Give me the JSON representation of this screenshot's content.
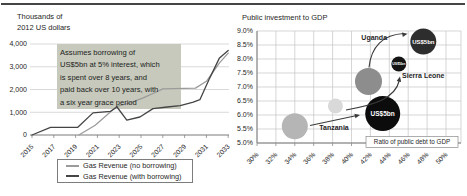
{
  "figure": {
    "rule_color": "#454545",
    "background": "#ffffff"
  },
  "left_chart": {
    "y_axis_title_lines": [
      "Thousands of",
      "2012 US dollars"
    ],
    "y_ticks": [
      "4,000",
      "3,000",
      "2,000",
      "1,000",
      "0"
    ],
    "x_ticks": [
      "2015",
      "2017",
      "2019",
      "2021",
      "2023",
      "2025",
      "2027",
      "2029",
      "2031",
      "2033"
    ],
    "annotation_bg": "#c6c9bb",
    "annotation_lines": [
      "Assumes borrowing of",
      "US$5bn at 5% interest, which",
      "is spent over 8 years, and",
      "paid back over 10 years, with",
      "a six year grace period"
    ],
    "legend": [
      {
        "label": "Gas Revenue (no borrowing)",
        "color": "#9b9b9b"
      },
      {
        "label": "Gas Revenue (with borrowing)",
        "color": "#454545"
      }
    ]
  },
  "right_chart": {
    "title": "Public investment to GDP",
    "x_axis_label": "Ratio of public debt to GDP",
    "y_ticks": [
      "9.0%",
      "8.5%",
      "8.0%",
      "7.5%",
      "7.0%",
      "6.5%",
      "6.0%",
      "5.5%",
      "5.0%"
    ],
    "x_ticks": [
      "30%",
      "32%",
      "34%",
      "36%",
      "38%",
      "40%",
      "42%",
      "44%",
      "46%",
      "48%",
      "50%"
    ]
  },
  "chart_data": [
    {
      "type": "line",
      "title": "Thousands of 2012 US dollars",
      "xlabel": "Year",
      "ylabel": "Thousands of 2012 US dollars",
      "xlim": [
        2015,
        2033
      ],
      "ylim": [
        0,
        4000
      ],
      "grid": "horizontal only",
      "legend_position": "bottom center, boxed",
      "annotation": "Assumes borrowing of US$5bn at 5% interest, which is spent over 8 years, and paid back over 10 years, with a six year grace period",
      "series": [
        {
          "name": "Gas Revenue (no borrowing)",
          "color": "#9b9b9b",
          "points": [
            [
              2019.3,
              0
            ],
            [
              2020.8,
              430
            ],
            [
              2021.9,
              890
            ],
            [
              2022.8,
              1260
            ],
            [
              2024,
              1410
            ],
            [
              2025.2,
              1630
            ],
            [
              2026.4,
              1890
            ],
            [
              2027,
              2030
            ],
            [
              2030,
              2060
            ],
            [
              2031,
              2360
            ],
            [
              2032.2,
              3170
            ],
            [
              2033,
              3600
            ]
          ]
        },
        {
          "name": "Gas Revenue (with borrowing)",
          "color": "#454545",
          "points": [
            [
              2015,
              0
            ],
            [
              2016.7,
              340
            ],
            [
              2019.2,
              340
            ],
            [
              2020.6,
              970
            ],
            [
              2022.2,
              1040
            ],
            [
              2022.8,
              1230
            ],
            [
              2023.7,
              650
            ],
            [
              2024.9,
              790
            ],
            [
              2026.1,
              1160
            ],
            [
              2027.4,
              1230
            ],
            [
              2028.6,
              1290
            ],
            [
              2029.8,
              1440
            ],
            [
              2030.4,
              1550
            ],
            [
              2031.3,
              2500
            ],
            [
              2032.2,
              3390
            ],
            [
              2033,
              3720
            ]
          ]
        }
      ]
    },
    {
      "type": "scatter",
      "title": "Public investment to GDP",
      "xlabel": "Ratio of public debt to GDP",
      "ylabel": "Public investment to GDP",
      "xlim": [
        30,
        50
      ],
      "ylim": [
        5.0,
        9.0
      ],
      "grid": "full",
      "bubbles": [
        {
          "name": "tanzania-current",
          "x": 34.0,
          "y": 5.6,
          "r": 13,
          "color": "#b5b5b5"
        },
        {
          "name": "sierra-leone-current",
          "x": 38.3,
          "y": 6.32,
          "r": 7.5,
          "color": "#d9d9d9"
        },
        {
          "name": "uganda-current",
          "x": 41.8,
          "y": 7.2,
          "r": 13.5,
          "color": "#8d8d8d"
        },
        {
          "name": "us5bn-tanzania",
          "x": 43.3,
          "y": 6.05,
          "r": 17.5,
          "color": "#0c0c0c",
          "label_inside": "US$5bn",
          "label_size": 6.5
        },
        {
          "name": "us5bn-sierra-leone",
          "x": 45.0,
          "y": 7.82,
          "r": 7.5,
          "color": "#141414",
          "label_inside": "US$5bn",
          "label_size": 3.5
        },
        {
          "name": "us5bn-uganda",
          "x": 47.6,
          "y": 8.62,
          "r": 13,
          "color": "#2d2d2d",
          "label_inside": "US$5bn",
          "label_size": 6
        }
      ],
      "labels": [
        {
          "name": "tanzania",
          "text": "Tanzania",
          "x": 38.15,
          "y": 5.46,
          "anchor": "middle"
        },
        {
          "name": "uganda",
          "text": "Uganda",
          "x": 42.4,
          "y": 8.68,
          "anchor": "middle"
        },
        {
          "name": "sierra-leone",
          "text": "Sierra Leone",
          "x": 45.35,
          "y": 7.32,
          "anchor": "start"
        }
      ],
      "arrows": [
        {
          "from": "tanzania-current",
          "to": "us5bn-tanzania"
        },
        {
          "from": "sierra-leone-current",
          "to": "us5bn-sierra-leone"
        },
        {
          "from": "uganda-current",
          "to": "us5bn-uganda"
        }
      ]
    }
  ]
}
